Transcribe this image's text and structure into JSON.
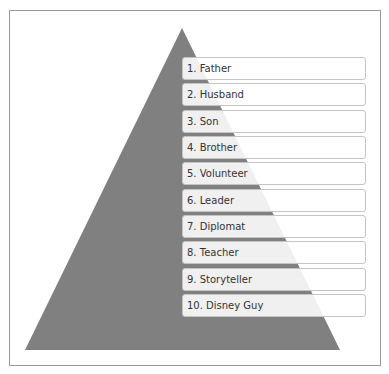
{
  "diagram": {
    "type": "pyramid",
    "colors": {
      "pyramid_fill": "#808080",
      "frame_border": "#9a9a9a",
      "box_border": "#c4c4c4",
      "text": "#333333"
    },
    "items": [
      {
        "rank": 1,
        "label": "1. Father"
      },
      {
        "rank": 2,
        "label": "2. Husband"
      },
      {
        "rank": 3,
        "label": "3. Son"
      },
      {
        "rank": 4,
        "label": "4. Brother"
      },
      {
        "rank": 5,
        "label": "5. Volunteer"
      },
      {
        "rank": 6,
        "label": "6. Leader"
      },
      {
        "rank": 7,
        "label": "7. Diplomat"
      },
      {
        "rank": 8,
        "label": "8. Teacher"
      },
      {
        "rank": 9,
        "label": "9. Storyteller"
      },
      {
        "rank": 10,
        "label": "10. Disney Guy"
      }
    ]
  }
}
